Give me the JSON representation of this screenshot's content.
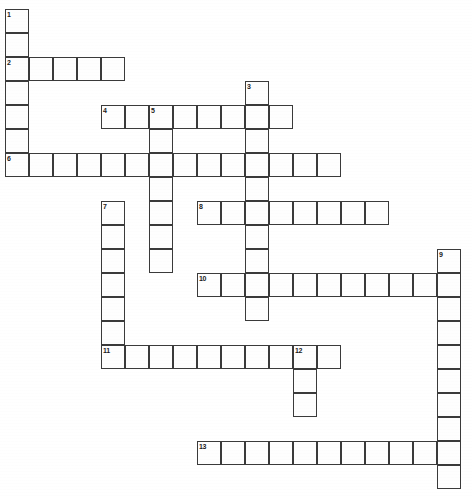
{
  "document": {
    "type": "crossword-puzzle-grid",
    "title": "Crossword Puzzle",
    "background_color": "#ffffff",
    "cell_fill_color": "#ffffff",
    "cell_border_color": "#3a3a3a",
    "number_color": "#1a1a1a"
  },
  "grid": {
    "cell_size": 24,
    "origin_x": 5,
    "origin_y": 9,
    "columns": 20,
    "rows": 21
  },
  "entries": [
    {
      "number": "1",
      "direction": "down",
      "row": 0,
      "col": 0,
      "length": 7
    },
    {
      "number": "2",
      "direction": "across",
      "row": 2,
      "col": 0,
      "length": 5
    },
    {
      "number": "3",
      "direction": "down",
      "row": 3,
      "col": 10,
      "length": 10
    },
    {
      "number": "4",
      "direction": "across",
      "row": 4,
      "col": 4,
      "length": 8
    },
    {
      "number": "5",
      "direction": "down",
      "row": 4,
      "col": 6,
      "length": 7
    },
    {
      "number": "6",
      "direction": "across",
      "row": 6,
      "col": 0,
      "length": 14
    },
    {
      "number": "7",
      "direction": "down",
      "row": 8,
      "col": 4,
      "length": 7
    },
    {
      "number": "8",
      "direction": "across",
      "row": 8,
      "col": 8,
      "length": 8
    },
    {
      "number": "9",
      "direction": "down",
      "row": 10,
      "col": 18,
      "length": 10
    },
    {
      "number": "10",
      "direction": "across",
      "row": 11,
      "col": 8,
      "length": 11
    },
    {
      "number": "11",
      "direction": "across",
      "row": 14,
      "col": 4,
      "length": 10
    },
    {
      "number": "12",
      "direction": "down",
      "row": 14,
      "col": 12,
      "length": 3
    },
    {
      "number": "13",
      "direction": "across",
      "row": 18,
      "col": 8,
      "length": 11
    }
  ],
  "clue_numbers": [
    "1",
    "2",
    "3",
    "4",
    "5",
    "6",
    "7",
    "8",
    "9",
    "10",
    "11",
    "12",
    "13"
  ]
}
